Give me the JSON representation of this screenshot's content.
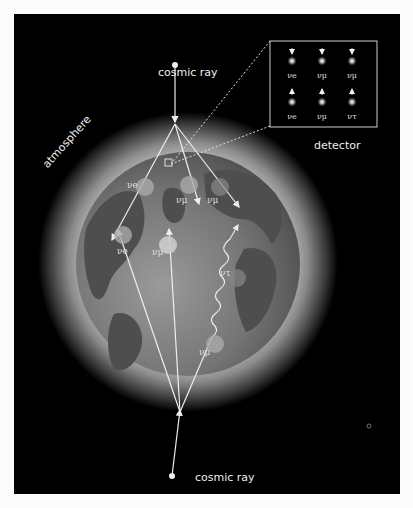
{
  "labels": {
    "cosmic_ray_top": "cosmic ray",
    "cosmic_ray_bottom": "cosmic ray",
    "atmosphere": "atmosphere",
    "detector": "detector"
  },
  "detector_grid": {
    "top_row": [
      {
        "direction": "down",
        "label": "νe"
      },
      {
        "direction": "down",
        "label": "νμ"
      },
      {
        "direction": "down",
        "label": "νμ"
      }
    ],
    "bottom_row": [
      {
        "direction": "up",
        "label": "νe"
      },
      {
        "direction": "up",
        "label": "νμ"
      },
      {
        "direction": "up",
        "label": "ντ"
      }
    ]
  },
  "neutrinos_on_earth": [
    {
      "label": "νe",
      "position": "upper-left, downward"
    },
    {
      "label": "νμ",
      "position": "upper-center, downward"
    },
    {
      "label": "νμ",
      "position": "upper-right, downward"
    },
    {
      "label": "νe",
      "position": "left, upward"
    },
    {
      "label": "νμ",
      "position": "center, upward"
    },
    {
      "label": "ντ",
      "position": "right, oscillated"
    },
    {
      "label": "νμ",
      "position": "lower-right, upward"
    }
  ],
  "colors": {
    "background": "#000000",
    "earth_ocean": "#7a7a7a",
    "earth_land": "#555555",
    "atmosphere_glow": "#9a9a9a",
    "lines": "#eeeeee"
  }
}
